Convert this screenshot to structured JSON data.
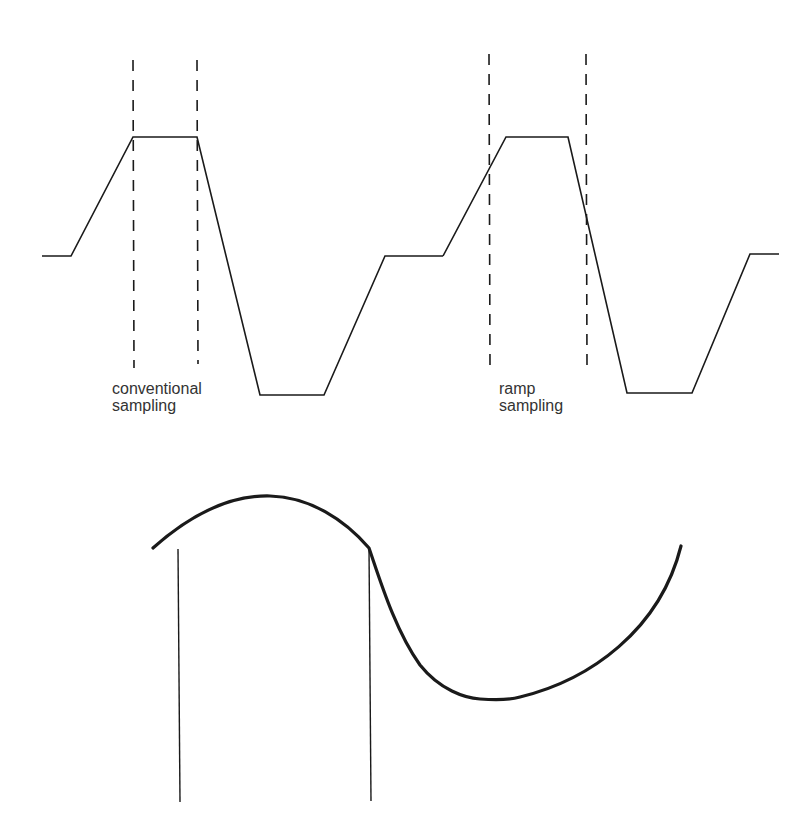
{
  "diagram": {
    "panels": [
      {
        "id": "conventional",
        "label_line1": "conventional",
        "label_line2": "sampling",
        "waveform": "trapezoid",
        "sample_markers": "dashed lines at start and end of flat top"
      },
      {
        "id": "ramp",
        "label_line1": "ramp",
        "label_line2": "sampling",
        "waveform": "trapezoid",
        "sample_markers": "dashed lines on rising and falling ramps"
      }
    ],
    "bottom": {
      "description": "sinusoidal curve with two solid vertical sample lines"
    }
  }
}
